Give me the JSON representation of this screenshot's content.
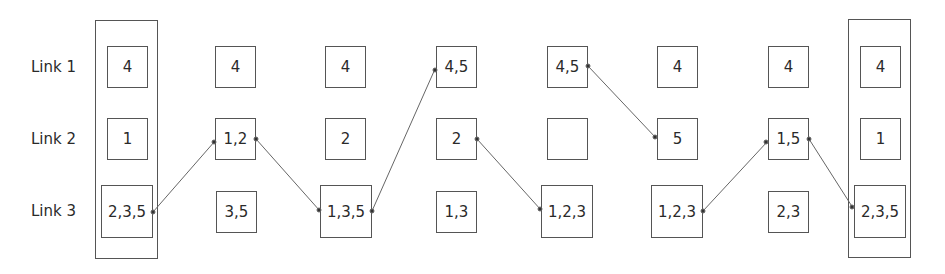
{
  "row_labels": [
    "Link 1",
    "Link 2",
    "Link 3"
  ],
  "columns": [
    {
      "link1": "4",
      "link2": "1",
      "link3": "2,3,5",
      "grouped": true
    },
    {
      "link1": "4",
      "link2": "1,2",
      "link3": "3,5",
      "grouped": false
    },
    {
      "link1": "4",
      "link2": "2",
      "link3": "1,3,5",
      "grouped": false
    },
    {
      "link1": "4,5",
      "link2": "2",
      "link3": "1,3",
      "grouped": false
    },
    {
      "link1": "4,5",
      "link2": "",
      "link3": "1,2,3",
      "grouped": false
    },
    {
      "link1": "4",
      "link2": "5",
      "link3": "1,2,3",
      "grouped": false
    },
    {
      "link1": "4",
      "link2": "1,5",
      "link3": "2,3",
      "grouped": false
    },
    {
      "link1": "4",
      "link2": "1",
      "link3": "2,3,5",
      "grouped": true
    }
  ],
  "transitions": [
    {
      "from": "col1.link3",
      "to": "col2.link2"
    },
    {
      "from": "col2.link2",
      "to": "col3.link3"
    },
    {
      "from": "col3.link3",
      "to": "col4.link1"
    },
    {
      "from": "col4.link2",
      "to": "col5.link3"
    },
    {
      "from": "col5.link1",
      "to": "col6.link2"
    },
    {
      "from": "col6.link3",
      "to": "col7.link2"
    },
    {
      "from": "col7.link2",
      "to": "col8.link3"
    }
  ]
}
